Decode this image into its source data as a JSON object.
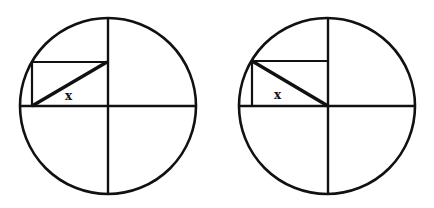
{
  "figures": [
    {
      "name": "left-figure",
      "circle": {
        "cx": 108,
        "cy": 106,
        "r": 88
      },
      "rectangle": {
        "x1": 32,
        "y1": 62,
        "x2": 107,
        "y2": 106
      },
      "diagonal": {
        "x1": 32,
        "y1": 106,
        "x2": 107,
        "y2": 62,
        "direction": "bottom-left to top-right"
      },
      "label": {
        "text": "x",
        "x": 69,
        "y": 100
      }
    },
    {
      "name": "right-figure",
      "circle": {
        "cx": 327,
        "cy": 106,
        "r": 88
      },
      "rectangle": {
        "x1": 252,
        "y1": 61,
        "x2": 328,
        "y2": 106
      },
      "diagonal": {
        "x1": 252,
        "y1": 61,
        "x2": 328,
        "y2": 106,
        "direction": "top-left to bottom-right"
      },
      "label": {
        "text": "x",
        "x": 278,
        "y": 99
      }
    }
  ],
  "colors": {
    "stroke": "#111111",
    "background": "#ffffff"
  }
}
